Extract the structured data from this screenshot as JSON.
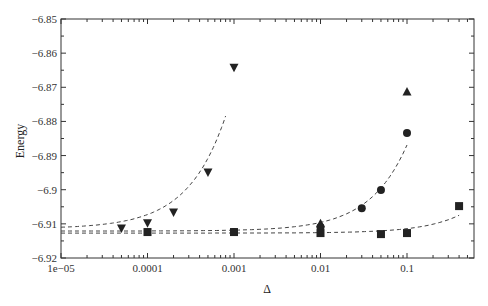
{
  "chart_data": {
    "type": "scatter",
    "title": "",
    "xlabel": "Δ",
    "ylabel": "Energy",
    "xscale": "log",
    "xlim": [
      1e-05,
      0.55
    ],
    "ylim": [
      -6.92,
      -6.85
    ],
    "x_ticks": [
      {
        "value": 1e-05,
        "label": "1e−05"
      },
      {
        "value": 0.0001,
        "label": "0.0001"
      },
      {
        "value": 0.001,
        "label": "0.001"
      },
      {
        "value": 0.01,
        "label": "0.01"
      },
      {
        "value": 0.1,
        "label": "0.1"
      }
    ],
    "y_ticks": [
      {
        "value": -6.85,
        "label": "−6.85"
      },
      {
        "value": -6.86,
        "label": "−6.86"
      },
      {
        "value": -6.87,
        "label": "−6.87"
      },
      {
        "value": -6.88,
        "label": "−6.88"
      },
      {
        "value": -6.89,
        "label": "−6.89"
      },
      {
        "value": -6.9,
        "label": "−6.9"
      },
      {
        "value": -6.91,
        "label": "−6.91"
      },
      {
        "value": -6.92,
        "label": "−6.92"
      }
    ],
    "grid": false,
    "legend": null,
    "series": [
      {
        "name": "triangle-down",
        "marker": "triangle-down",
        "x": [
          5e-05,
          0.0001,
          0.0002,
          0.0005,
          0.001
        ],
        "y": [
          -6.9112,
          -6.9097,
          -6.9065,
          -6.8948,
          -6.8641
        ],
        "fit": {
          "x_start": 1e-05,
          "x_end": 0.0008,
          "y_start": -6.9114,
          "y_end": -6.8784
        }
      },
      {
        "name": "triangle-up",
        "marker": "triangle-up",
        "x": [
          0.01,
          0.1
        ],
        "y": [
          -6.91,
          -6.8714
        ],
        "fit": null
      },
      {
        "name": "circle",
        "marker": "circle",
        "x": [
          0.001,
          0.01,
          0.03,
          0.05,
          0.1
        ],
        "y": [
          -6.9124,
          -6.9109,
          -6.9054,
          -6.9001,
          -6.8834
        ],
        "fit": {
          "x_start": 1e-05,
          "x_end": 0.1,
          "y_start": -6.9121,
          "y_end": -6.8869
        }
      },
      {
        "name": "square",
        "marker": "square",
        "x": [
          0.0001,
          0.001,
          0.01,
          0.05,
          0.1,
          0.4
        ],
        "y": [
          -6.9124,
          -6.9124,
          -6.9127,
          -6.913,
          -6.9127,
          -6.9048
        ],
        "fit": {
          "x_start": 1e-05,
          "x_end": 0.4,
          "y_start": -6.9127,
          "y_end": -6.9075
        }
      }
    ]
  }
}
